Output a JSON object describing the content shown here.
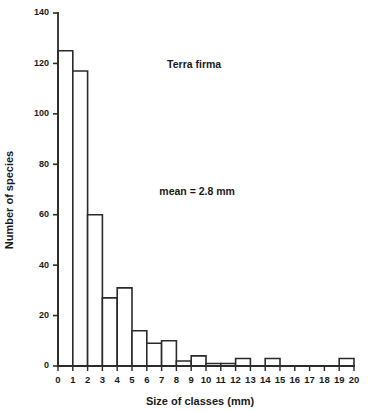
{
  "chart_data": {
    "type": "bar",
    "title": "",
    "subtitle": "",
    "xlabel": "Size of classes (mm)",
    "ylabel": "Number of species",
    "xlim": [
      0,
      20
    ],
    "ylim": [
      0,
      140
    ],
    "grid": false,
    "legend": null,
    "bin_width": 1,
    "bin_edges": [
      0,
      1,
      2,
      3,
      4,
      5,
      6,
      7,
      8,
      9,
      10,
      11,
      12,
      13,
      14,
      15,
      16,
      17,
      18,
      19,
      20
    ],
    "categories": [
      "0-1",
      "1-2",
      "2-3",
      "3-4",
      "4-5",
      "5-6",
      "6-7",
      "7-8",
      "8-9",
      "9-10",
      "10-11",
      "11-12",
      "12-13",
      "13-14",
      "14-15",
      "15-16",
      "16-17",
      "17-18",
      "18-19",
      "19-20"
    ],
    "values": [
      125,
      117,
      60,
      27,
      31,
      14,
      9,
      10,
      2,
      4,
      1,
      1,
      3,
      0,
      3,
      0,
      0,
      0,
      0,
      3
    ],
    "xticks": [
      0,
      1,
      2,
      3,
      4,
      5,
      6,
      7,
      8,
      9,
      10,
      11,
      12,
      13,
      14,
      15,
      16,
      17,
      18,
      19,
      20
    ],
    "xtick_labels": [
      "0",
      "1",
      "2",
      "3",
      "4",
      "5",
      "6",
      "7",
      "8",
      "9",
      "10",
      "11",
      "12",
      "13",
      "14",
      "15",
      "16",
      "17",
      "18",
      "19",
      "20"
    ],
    "yticks": [
      0,
      20,
      40,
      60,
      80,
      100,
      120,
      140
    ],
    "ytick_labels": [
      "0",
      "20",
      "40",
      "60",
      "80",
      "100",
      "120",
      "140"
    ],
    "annotations": [
      {
        "text": "Terra firma",
        "x": 9.2,
        "y": 118
      },
      {
        "text": "mean = 2.8 mm",
        "x": 9.4,
        "y": 68
      }
    ],
    "colors": {
      "bar_fill": "#ffffff",
      "bar_stroke": "#2b2b2b",
      "axis": "#2b2b2b",
      "text": "#1a1a1a",
      "background": "#ffffff"
    }
  }
}
